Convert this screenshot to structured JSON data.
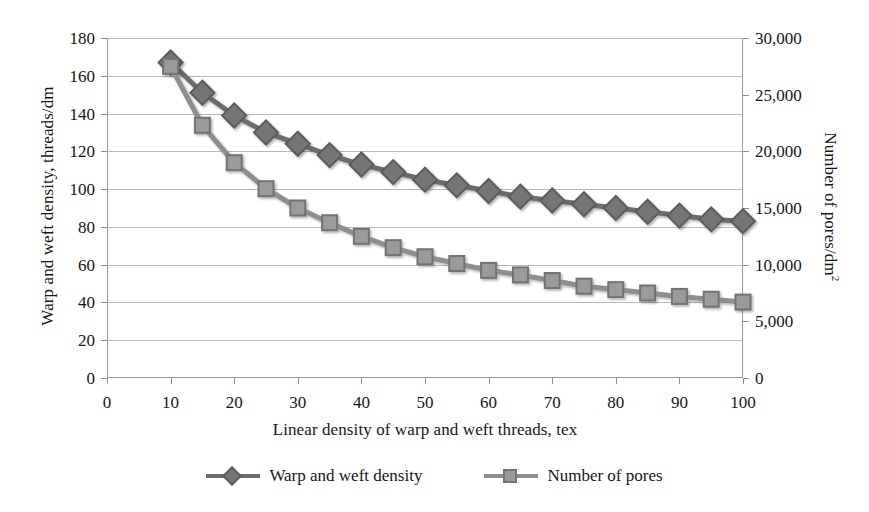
{
  "chart_data": {
    "type": "line",
    "title": "",
    "subtitle": "",
    "xlabel": "Linear density of warp and weft threads, tex",
    "ylabel": "Warp and weft density, threads/dm",
    "y2label": "Number of pores/dm²",
    "grid": true,
    "legend_position": "bottom",
    "xlim": [
      0,
      100
    ],
    "ylim": [
      0,
      180
    ],
    "y2lim": [
      0,
      30000
    ],
    "xticks": [
      0,
      10,
      20,
      30,
      40,
      50,
      60,
      70,
      80,
      90,
      100
    ],
    "xticklabels": [
      "0",
      "10",
      "20",
      "30",
      "40",
      "50",
      "60",
      "70",
      "80",
      "90",
      "100"
    ],
    "yticks": [
      0,
      20,
      40,
      60,
      80,
      100,
      120,
      140,
      160,
      180
    ],
    "yticklabels": [
      "0",
      "20",
      "40",
      "60",
      "80",
      "100",
      "120",
      "140",
      "160",
      "180"
    ],
    "y2ticks": [
      0,
      5000,
      10000,
      15000,
      20000,
      25000,
      30000
    ],
    "y2ticklabels": [
      "0",
      "5,000",
      "10,000",
      "15,000",
      "20,000",
      "25,000",
      "30,000"
    ],
    "x": [
      10,
      15,
      20,
      25,
      30,
      35,
      40,
      45,
      50,
      55,
      60,
      65,
      70,
      75,
      80,
      85,
      90,
      95,
      100
    ],
    "series": [
      {
        "name": "Warp and weft density",
        "axis": "left",
        "marker": "diamond",
        "color": "#6c6c6c",
        "values": [
          167,
          151,
          139,
          130,
          124,
          118,
          113,
          109,
          105,
          102,
          99,
          96,
          94,
          92,
          90,
          88,
          86,
          84,
          83
        ]
      },
      {
        "name": "Number of pores",
        "axis": "right",
        "marker": "square",
        "color": "#8e8e8e",
        "values": [
          27500,
          22300,
          19000,
          16700,
          15000,
          13700,
          12500,
          11500,
          10700,
          10100,
          9500,
          9100,
          8600,
          8100,
          7800,
          7500,
          7200,
          6950,
          6700
        ]
      }
    ],
    "legend": [
      {
        "label": "Warp and weft density",
        "marker": "diamond",
        "color": "#6c6c6c"
      },
      {
        "label": "Number of pores",
        "marker": "square",
        "color": "#8e8e8e"
      }
    ]
  },
  "colors": {
    "background": "#ffffff",
    "grid": "#b9b9b9",
    "axis": "#9a9a9a",
    "text": "#161616",
    "series_1": "#6c6c6c",
    "series_2": "#8e8e8e"
  }
}
